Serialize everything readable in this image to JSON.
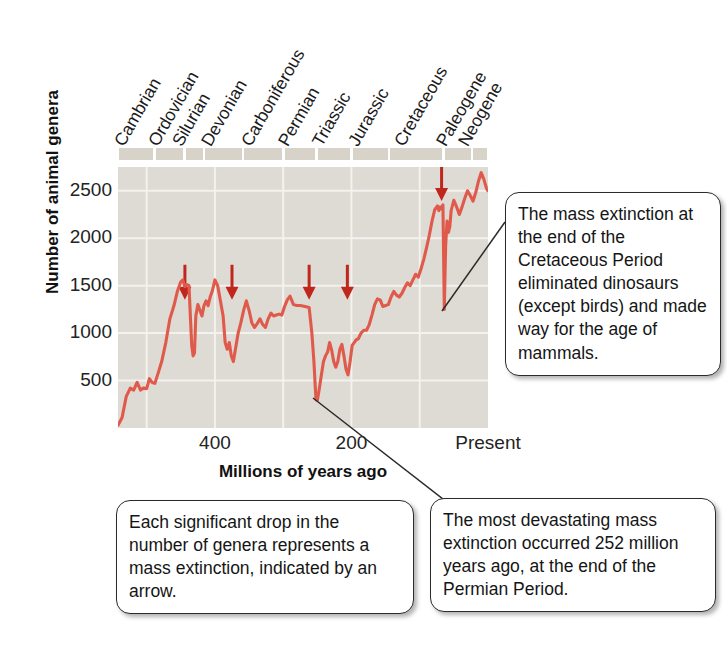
{
  "chart_data": {
    "type": "line",
    "title": "",
    "xlabel": "Millions of years ago",
    "ylabel": "Number of animal genera",
    "xlim": [
      542,
      0
    ],
    "ylim": [
      0,
      2750
    ],
    "xticks": [
      {
        "value": 400,
        "label": "400"
      },
      {
        "value": 200,
        "label": "200"
      },
      {
        "value": 0,
        "label": "Present"
      }
    ],
    "yticks": [
      {
        "value": 500,
        "label": "500"
      },
      {
        "value": 1000,
        "label": "1000"
      },
      {
        "value": 1500,
        "label": "1500"
      },
      {
        "value": 2000,
        "label": "2000"
      },
      {
        "value": 2500,
        "label": "2500"
      }
    ],
    "grid": true,
    "legend": null,
    "series_color": "#e05a4c",
    "series": [
      {
        "name": "Number of animal genera",
        "points": [
          [
            542,
            30
          ],
          [
            536,
            110
          ],
          [
            530,
            330
          ],
          [
            524,
            420
          ],
          [
            519,
            400
          ],
          [
            514,
            480
          ],
          [
            509,
            400
          ],
          [
            505,
            420
          ],
          [
            500,
            415
          ],
          [
            496,
            520
          ],
          [
            492,
            480
          ],
          [
            488,
            470
          ],
          [
            484,
            560
          ],
          [
            478,
            700
          ],
          [
            472,
            900
          ],
          [
            466,
            1150
          ],
          [
            460,
            1290
          ],
          [
            455,
            1440
          ],
          [
            450,
            1540
          ],
          [
            447,
            1560
          ],
          [
            444,
            1490
          ],
          [
            441,
            1510
          ],
          [
            438,
            1500
          ],
          [
            436,
            1180
          ],
          [
            434,
            870
          ],
          [
            432,
            760
          ],
          [
            430,
            790
          ],
          [
            428,
            1180
          ],
          [
            425,
            1300
          ],
          [
            422,
            1240
          ],
          [
            419,
            1180
          ],
          [
            416,
            1290
          ],
          [
            413,
            1340
          ],
          [
            410,
            1290
          ],
          [
            407,
            1380
          ],
          [
            404,
            1440
          ],
          [
            400,
            1560
          ],
          [
            396,
            1500
          ],
          [
            392,
            1340
          ],
          [
            388,
            1180
          ],
          [
            385,
            900
          ],
          [
            382,
            830
          ],
          [
            379,
            900
          ],
          [
            376,
            760
          ],
          [
            373,
            700
          ],
          [
            370,
            830
          ],
          [
            366,
            1000
          ],
          [
            362,
            1110
          ],
          [
            358,
            1240
          ],
          [
            354,
            1340
          ],
          [
            350,
            1240
          ],
          [
            346,
            1110
          ],
          [
            342,
            1060
          ],
          [
            338,
            1100
          ],
          [
            334,
            1150
          ],
          [
            330,
            1090
          ],
          [
            326,
            1060
          ],
          [
            322,
            1150
          ],
          [
            318,
            1210
          ],
          [
            314,
            1180
          ],
          [
            310,
            1190
          ],
          [
            306,
            1200
          ],
          [
            302,
            1190
          ],
          [
            298,
            1280
          ],
          [
            294,
            1350
          ],
          [
            290,
            1390
          ],
          [
            285,
            1300
          ],
          [
            280,
            1290
          ],
          [
            275,
            1290
          ],
          [
            268,
            1280
          ],
          [
            262,
            1270
          ],
          [
            258,
            1000
          ],
          [
            255,
            700
          ],
          [
            253,
            430
          ],
          [
            252,
            300
          ],
          [
            250,
            290
          ],
          [
            247,
            420
          ],
          [
            244,
            560
          ],
          [
            241,
            700
          ],
          [
            238,
            760
          ],
          [
            235,
            800
          ],
          [
            232,
            900
          ],
          [
            229,
            820
          ],
          [
            226,
            700
          ],
          [
            223,
            640
          ],
          [
            220,
            700
          ],
          [
            217,
            830
          ],
          [
            214,
            880
          ],
          [
            211,
            760
          ],
          [
            208,
            620
          ],
          [
            205,
            560
          ],
          [
            202,
            700
          ],
          [
            199,
            870
          ],
          [
            196,
            900
          ],
          [
            193,
            930
          ],
          [
            190,
            940
          ],
          [
            186,
            1000
          ],
          [
            182,
            1030
          ],
          [
            178,
            1030
          ],
          [
            174,
            1090
          ],
          [
            170,
            1190
          ],
          [
            166,
            1300
          ],
          [
            162,
            1360
          ],
          [
            158,
            1350
          ],
          [
            154,
            1280
          ],
          [
            150,
            1290
          ],
          [
            146,
            1300
          ],
          [
            142,
            1380
          ],
          [
            138,
            1440
          ],
          [
            134,
            1400
          ],
          [
            130,
            1380
          ],
          [
            126,
            1420
          ],
          [
            122,
            1480
          ],
          [
            118,
            1530
          ],
          [
            114,
            1500
          ],
          [
            110,
            1560
          ],
          [
            106,
            1620
          ],
          [
            102,
            1590
          ],
          [
            98,
            1680
          ],
          [
            94,
            1780
          ],
          [
            90,
            1900
          ],
          [
            86,
            2030
          ],
          [
            82,
            2180
          ],
          [
            78,
            2300
          ],
          [
            74,
            2340
          ],
          [
            72,
            2290
          ],
          [
            70,
            2330
          ],
          [
            68,
            2310
          ],
          [
            66,
            2350
          ],
          [
            65,
            1800
          ],
          [
            64,
            1250
          ],
          [
            63,
            1600
          ],
          [
            62,
            1930
          ],
          [
            60,
            2180
          ],
          [
            58,
            2060
          ],
          [
            56,
            2120
          ],
          [
            54,
            2290
          ],
          [
            50,
            2400
          ],
          [
            46,
            2330
          ],
          [
            42,
            2250
          ],
          [
            38,
            2330
          ],
          [
            34,
            2420
          ],
          [
            30,
            2500
          ],
          [
            26,
            2450
          ],
          [
            22,
            2390
          ],
          [
            18,
            2480
          ],
          [
            14,
            2600
          ],
          [
            10,
            2690
          ],
          [
            6,
            2620
          ],
          [
            2,
            2520
          ],
          [
            0,
            2500
          ]
        ]
      }
    ],
    "annotations": {
      "extinction_arrows": [
        {
          "name": "ordovician-silurian",
          "x_value": 444,
          "y_value": 1720,
          "color": "#c0271c"
        },
        {
          "name": "late-devonian",
          "x_value": 375,
          "y_value": 1720,
          "color": "#c0271c"
        },
        {
          "name": "permian-triassic",
          "x_value": 262,
          "y_value": 1720,
          "color": "#c0271c"
        },
        {
          "name": "triassic-jurassic",
          "x_value": 206,
          "y_value": 1720,
          "color": "#c0271c"
        },
        {
          "name": "cretaceous-paleogene",
          "x_value": 68,
          "y_value": 2760,
          "color": "#c0271c"
        }
      ]
    },
    "geologic_periods": [
      {
        "label": "Cambrian",
        "start": 542,
        "end": 488,
        "color": "#d8d3c8"
      },
      {
        "label": "Ordovician",
        "start": 488,
        "end": 444,
        "color": "#d8d3c8"
      },
      {
        "label": "Silurian",
        "start": 444,
        "end": 416,
        "color": "#d8d3c8"
      },
      {
        "label": "Devonian",
        "start": 416,
        "end": 359,
        "color": "#d8d3c8"
      },
      {
        "label": "Carboniferous",
        "start": 359,
        "end": 299,
        "color": "#d8d3c8"
      },
      {
        "label": "Permian",
        "start": 299,
        "end": 251,
        "color": "#d8d3c8"
      },
      {
        "label": "Triassic",
        "start": 251,
        "end": 200,
        "color": "#d8d3c8"
      },
      {
        "label": "Jurassic",
        "start": 200,
        "end": 145,
        "color": "#d8d3c8"
      },
      {
        "label": "Cretaceous",
        "start": 145,
        "end": 65,
        "color": "#d8d3c8"
      },
      {
        "label": "Paleogene",
        "start": 65,
        "end": 23,
        "color": "#d8d3c8"
      },
      {
        "label": "Neogene",
        "start": 23,
        "end": 0,
        "color": "#d8d3c8"
      }
    ]
  },
  "axis": {
    "ylabel": "Number of animal genera",
    "xlabel": "Millions of years ago"
  },
  "callouts": [
    {
      "id": "cretaceous",
      "text": "The mass extinction at the end of the Cretaceous Period eliminated dinosaurs (except birds) and made way for the age of mammals."
    },
    {
      "id": "arrows",
      "text": "Each significant drop in the number of genera represents a mass extinction, indicated by an arrow."
    },
    {
      "id": "permian",
      "text": "The most devastating mass extinction occurred 252 million years ago, at the end of the Permian Period."
    }
  ]
}
